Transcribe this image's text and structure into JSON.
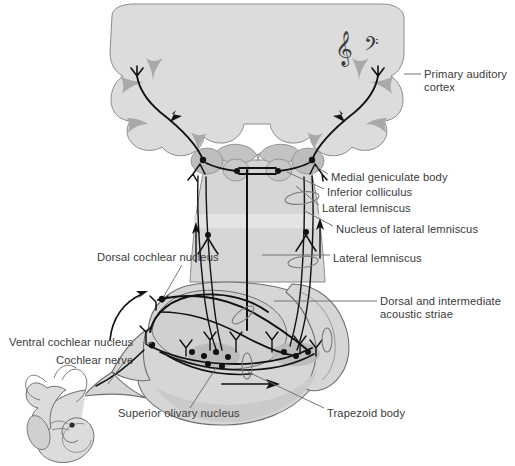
{
  "figure": {
    "type": "anatomical-diagram",
    "background_color": "#ffffff",
    "brain_fill": "#dcdcdc",
    "brainstem_fill": "#d2d2d2",
    "nucleus_fill": "#bcbcbc",
    "outline_color": "#6e6e6e",
    "pathway_color": "#111111",
    "label_color": "#3a3a3a",
    "leader_color": "#666666"
  },
  "labels": {
    "primary_auditory_cortex": "Primary auditory\ncortex",
    "medial_geniculate_body": "Medial geniculate body",
    "inferior_colliculus": "Inferior colliculus",
    "lateral_lemniscus_upper": "Lateral lemniscus",
    "nucleus_of_lateral_lemniscus": "Nucleus of lateral lemniscus",
    "lateral_lemniscus_lower": "Lateral lemniscus",
    "dorsal_cochlear_nucleus": "Dorsal cochlear nucleus",
    "dorsal_and_intermediate_acoustic_striae": "Dorsal and intermediate\nacoustic striae",
    "ventral_cochlear_nucleus": "Ventral cochlear nucleus",
    "cochlear_nerve": "Cochlear nerve",
    "superior_olivary_nucleus": "Superior olivary nucleus",
    "trapezoid_body": "Trapezoid body"
  },
  "icons": {
    "treble_clef": "treble-clef-icon",
    "bass_clef": "bass-clef-icon",
    "cochlea": "cochlea-icon",
    "semicircular_canals": "semicircular-canals-icon"
  },
  "label_positions": {
    "primary_auditory_cortex": {
      "x": 424,
      "y": 68
    },
    "medial_geniculate_body": {
      "x": 331,
      "y": 177
    },
    "inferior_colliculus": {
      "x": 327,
      "y": 192
    },
    "lateral_lemniscus_upper": {
      "x": 322,
      "y": 208
    },
    "nucleus_of_lateral_lemniscus": {
      "x": 336,
      "y": 229
    },
    "lateral_lemniscus_lower": {
      "x": 333,
      "y": 258
    },
    "dorsal_cochlear_nucleus": {
      "x": 97,
      "y": 257
    },
    "dorsal_and_intermediate_acoustic_striae": {
      "x": 380,
      "y": 301
    },
    "ventral_cochlear_nucleus": {
      "x": 9,
      "y": 339
    },
    "cochlear_nerve": {
      "x": 56,
      "y": 357
    },
    "superior_olivary_nucleus": {
      "x": 118,
      "y": 412
    },
    "trapezoid_body": {
      "x": 327,
      "y": 412
    }
  }
}
